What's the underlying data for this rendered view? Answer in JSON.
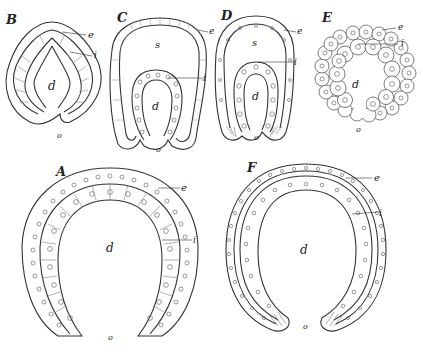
{
  "figures": [
    {
      "id": "B",
      "label": "B",
      "labels": {
        "e": "e",
        "i": "i",
        "d": "d",
        "o": "o"
      }
    },
    {
      "id": "C",
      "label": "C",
      "labels": {
        "e": "e",
        "s": "s",
        "i": "i",
        "d": "d",
        "o": "o"
      }
    },
    {
      "id": "D",
      "label": "D",
      "labels": {
        "e": "e",
        "s": "s",
        "i": "i",
        "d": "d",
        "o": "o"
      }
    },
    {
      "id": "E",
      "label": "E",
      "labels": {
        "e": "e",
        "i": "i",
        "d": "d",
        "o": "o"
      }
    },
    {
      "id": "A",
      "label": "A",
      "labels": {
        "e": "e",
        "i": "i",
        "d": "d",
        "o": "o"
      }
    },
    {
      "id": "F",
      "label": "F",
      "labels": {
        "e": "e",
        "i": "i",
        "d": "d",
        "o": "o"
      }
    }
  ],
  "legend": {
    "e": "ectoderm",
    "i": "endoderm",
    "d": "primitive gut cavity",
    "s": "segmentation cavity",
    "o": "blastopore (mouth)"
  }
}
